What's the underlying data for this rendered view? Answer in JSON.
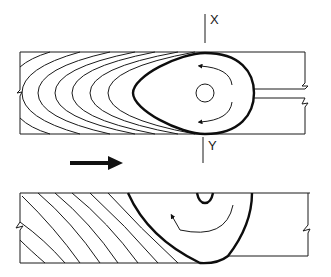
{
  "diagram": {
    "type": "technical-illustration",
    "section_markers": [
      {
        "label": "X",
        "position": "top"
      },
      {
        "label": "Y",
        "position": "bottom"
      }
    ],
    "direction_arrow": "right",
    "panels": [
      {
        "name": "top-view",
        "features": [
          "growth-rings",
          "teardrop-knot",
          "center-pith-circle",
          "rotation-arrows"
        ]
      },
      {
        "name": "section-view",
        "features": [
          "diagonal-growth-rings",
          "knot-section",
          "pith-notch",
          "rotation-arrow"
        ]
      }
    ],
    "colors": {
      "ink": "#1a1a1a",
      "background": "#ffffff"
    }
  }
}
